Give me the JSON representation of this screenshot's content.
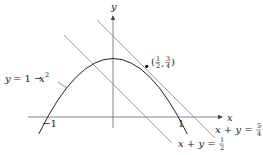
{
  "axes": {
    "x_label": "x",
    "y_label": "y",
    "tick_neg": "−1",
    "tick_pos": "1"
  },
  "curve": {
    "label_lhs": "y",
    "label_eq": "= 1 − ",
    "label_var": "x",
    "label_exp": "2"
  },
  "point": {
    "label_open": "(",
    "frac1_num": "1",
    "frac1_den": "2",
    "comma": ",",
    "frac2_num": "3",
    "frac2_den": "4",
    "label_close": ")"
  },
  "line_tangent": {
    "lhs": "x + y =",
    "num": "5",
    "den": "4"
  },
  "line_half": {
    "lhs": "x + y =",
    "num": "1",
    "den": "2"
  },
  "colors": {
    "curve": "#222222",
    "lines": "#8a8a8a",
    "axes": "#555555"
  }
}
